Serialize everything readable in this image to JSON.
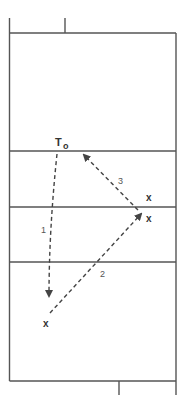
{
  "diagram": {
    "type": "volleyball-court-drill",
    "colors": {
      "line": "#444444",
      "path": "#444444",
      "text": "#333333"
    },
    "players": [
      {
        "id": "setter-target",
        "label": "T",
        "sub": "o",
        "x": 55,
        "y": 146
      },
      {
        "id": "player-upper-right",
        "label": "x",
        "x": 146,
        "y": 201
      },
      {
        "id": "player-right",
        "label": "x",
        "x": 146,
        "y": 222
      },
      {
        "id": "player-lower-left",
        "label": "x",
        "x": 43,
        "y": 327
      }
    ],
    "paths": [
      {
        "id": "path-1",
        "label": "1",
        "label_x": 41,
        "label_y": 233
      },
      {
        "id": "path-2",
        "label": "2",
        "label_x": 100,
        "label_y": 277
      },
      {
        "id": "path-3",
        "label": "3",
        "label_x": 118,
        "label_y": 184
      }
    ]
  }
}
